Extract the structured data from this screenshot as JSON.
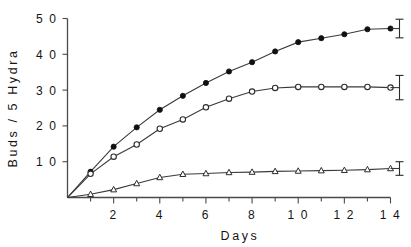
{
  "chart_data": {
    "type": "line",
    "title": "",
    "xlabel": "Days",
    "ylabel": "Buds / 5 Hydra",
    "xlim": [
      0,
      14
    ],
    "ylim": [
      0,
      50
    ],
    "grid": false,
    "legend": "none",
    "x_tick_labels": [
      "2",
      "4",
      "6",
      "8",
      "1 0",
      "1 2",
      "1 4"
    ],
    "x_tick_values": [
      2,
      4,
      6,
      8,
      10,
      12,
      14
    ],
    "x_minor_ticks": [
      1,
      3,
      5,
      7,
      9,
      11,
      13
    ],
    "y_tick_labels": [
      "1 0",
      "2 0",
      "3 0",
      "4 0",
      "5 0"
    ],
    "y_tick_values": [
      10,
      20,
      30,
      40,
      50
    ],
    "x": [
      0,
      1,
      2,
      3,
      4,
      5,
      6,
      7,
      8,
      9,
      10,
      11,
      12,
      13,
      14
    ],
    "series": [
      {
        "name": "filled-circle-series",
        "marker": "filled-circle",
        "values": [
          0,
          7.2,
          14.2,
          19.6,
          24.5,
          28.4,
          32.0,
          35.2,
          37.8,
          40.8,
          43.4,
          44.5,
          45.6,
          47.0,
          47.2
        ],
        "error_bar": {
          "x": 14,
          "y": 47.2,
          "plus": 2.6,
          "minus": 2.6
        }
      },
      {
        "name": "open-circle-series",
        "marker": "open-circle",
        "values": [
          0,
          6.6,
          11.4,
          14.8,
          19.2,
          21.8,
          25.2,
          27.6,
          29.6,
          30.6,
          30.9,
          30.9,
          30.9,
          30.9,
          30.7
        ],
        "error_bar": {
          "x": 14,
          "y": 30.7,
          "plus": 3.4,
          "minus": 3.4
        }
      },
      {
        "name": "open-triangle-series",
        "marker": "open-triangle",
        "values": [
          0,
          0.9,
          2.2,
          3.9,
          5.6,
          6.5,
          6.7,
          7.0,
          7.1,
          7.3,
          7.4,
          7.5,
          7.6,
          7.8,
          8.1
        ],
        "error_bar": {
          "x": 14,
          "y": 8.1,
          "plus": 1.9,
          "minus": 1.9
        }
      }
    ]
  }
}
